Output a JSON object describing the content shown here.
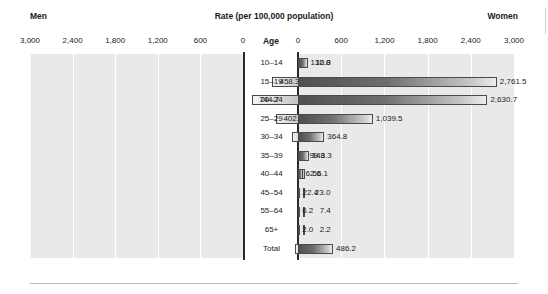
{
  "header": {
    "left_label": "Men",
    "title": "Rate (per 100,000 population)",
    "right_label": "Women",
    "age_column_header": "Age"
  },
  "axis": {
    "left_ticks": [
      "3,000",
      "2,400",
      "1,800",
      "1,200",
      "600",
      "0"
    ],
    "right_ticks": [
      "0",
      "600",
      "1,200",
      "1,800",
      "2,400",
      "3,000"
    ]
  },
  "chart_data": {
    "type": "bar",
    "title": "Rate (per 100,000 population)",
    "subtype": "population-pyramid",
    "orientation": "horizontal-diverging",
    "xlabel": "Rate (per 100,000 population)",
    "ylabel": "Age",
    "xlim": [
      0,
      3000
    ],
    "grid": true,
    "legend_position": "none",
    "categories": [
      "10–14",
      "15–19",
      "20–24",
      "25–29",
      "30–34",
      "35–39",
      "40–44",
      "45–54",
      "55–64",
      "65+",
      "Total"
    ],
    "series": [
      {
        "name": "Men",
        "side": "left",
        "axis_ticks": [
          "3,000",
          "2,400",
          "1,800",
          "1,200",
          "600",
          "0"
        ],
        "values": [
          10.8,
          458.3,
          744.7,
          402.9,
          185.2,
          99.3,
          56.1,
          23.0,
          7.4,
          2.2,
          147.5
        ],
        "labels": [
          "10.8",
          "458.3",
          "744.7",
          "402.9",
          "185.2",
          "99.3",
          "56.1",
          "23.0",
          "7.4",
          "2.2",
          "147.5"
        ]
      },
      {
        "name": "Women",
        "side": "right",
        "axis_ticks": [
          "0",
          "600",
          "1,200",
          "1,800",
          "2,400",
          "3,000"
        ],
        "values": [
          132.0,
          2761.5,
          2630.7,
          1039.5,
          364.8,
          148.3,
          62.6,
          22.4,
          6.2,
          2.0,
          486.2
        ],
        "labels": [
          "132.0",
          "2,761.5",
          "2,630.7",
          "1,039.5",
          "364.8",
          "148.3",
          "62.6",
          "22.4",
          "6.2",
          "2.0",
          "486.2"
        ]
      }
    ],
    "colors": {
      "men_bar_light": "#f2f2f2",
      "men_bar_dark": "#bdbdbd",
      "women_bar_dark": "#4f4f4f",
      "women_bar_light": "#ededed",
      "panel_background": "#e9e9e9",
      "gridline": "#ffffff",
      "axis": "#2b2b2b",
      "text": "#1a1a1a"
    }
  }
}
